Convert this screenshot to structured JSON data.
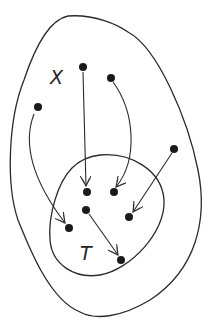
{
  "diagram": {
    "labels": {
      "outer_set": "X",
      "inner_set": "T"
    },
    "colors": {
      "stroke": "#2a2a2a",
      "dot": "#1a1a1a",
      "background": "#ffffff"
    },
    "points_outside_T": [
      {
        "id": "x1",
        "x": 83,
        "y": 67
      },
      {
        "id": "x2",
        "x": 111,
        "y": 78
      },
      {
        "id": "x3",
        "x": 38,
        "y": 107
      },
      {
        "id": "x4",
        "x": 174,
        "y": 149
      }
    ],
    "points_inside_T": [
      {
        "id": "t1",
        "x": 87,
        "y": 192
      },
      {
        "id": "t2",
        "x": 114,
        "y": 192
      },
      {
        "id": "t3",
        "x": 86,
        "y": 210
      },
      {
        "id": "t4",
        "x": 129,
        "y": 217
      },
      {
        "id": "t5",
        "x": 69,
        "y": 228
      },
      {
        "id": "t6",
        "x": 121,
        "y": 260
      }
    ],
    "arrows": [
      {
        "from": "x1",
        "to": "t1"
      },
      {
        "from": "x2",
        "to": "t2"
      },
      {
        "from": "x3",
        "to": "t5"
      },
      {
        "from": "x4",
        "to": "t4"
      },
      {
        "from": "t3",
        "to": "t6"
      }
    ]
  }
}
